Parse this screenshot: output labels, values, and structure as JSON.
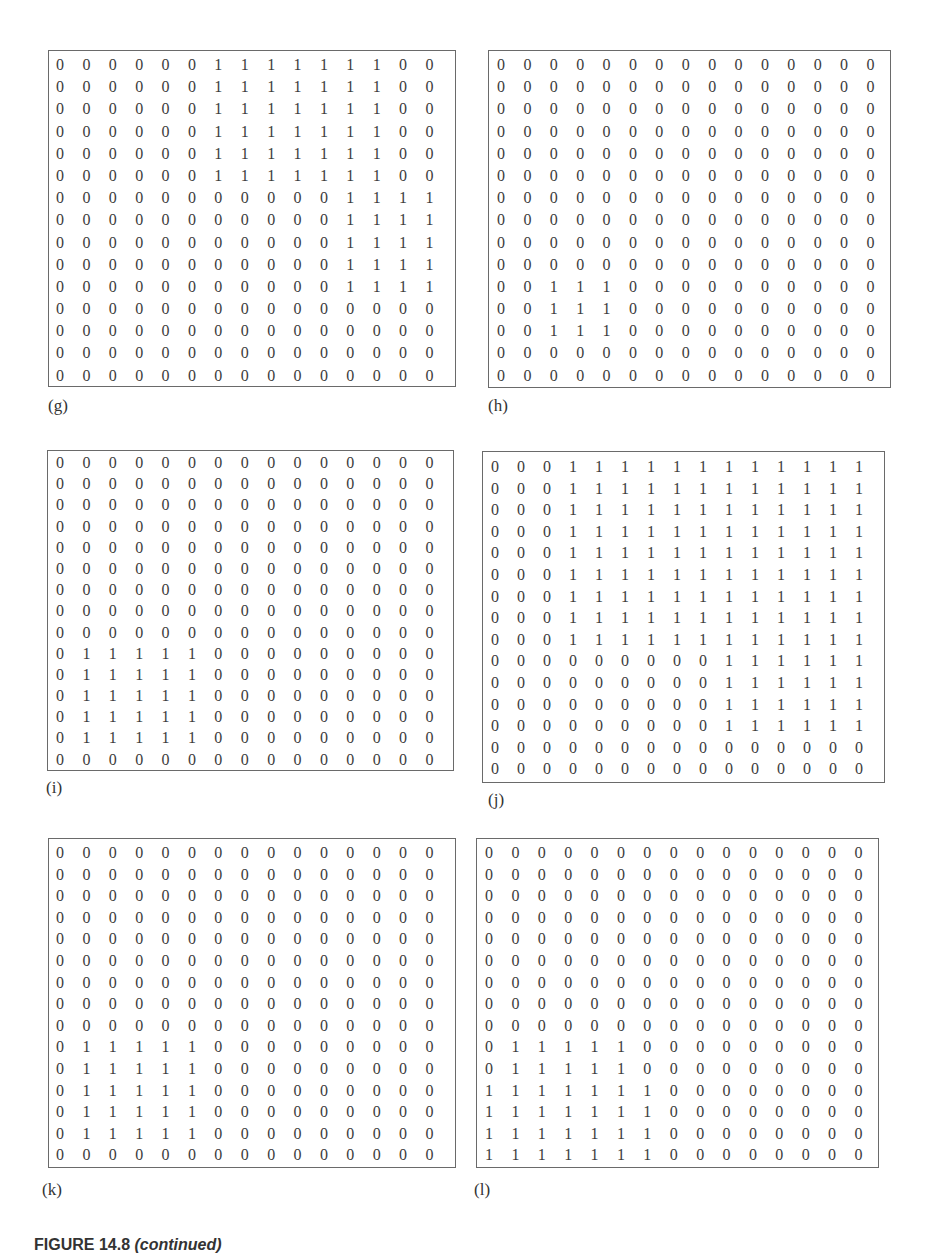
{
  "figure": {
    "caption_number": "FIGURE 14.8",
    "caption_suffix": "(continued)"
  },
  "panels": [
    {
      "label": "(g)",
      "matrix": [
        [
          0,
          0,
          0,
          0,
          0,
          0,
          1,
          1,
          1,
          1,
          1,
          1,
          1,
          0,
          0
        ],
        [
          0,
          0,
          0,
          0,
          0,
          0,
          1,
          1,
          1,
          1,
          1,
          1,
          1,
          0,
          0
        ],
        [
          0,
          0,
          0,
          0,
          0,
          0,
          1,
          1,
          1,
          1,
          1,
          1,
          1,
          0,
          0
        ],
        [
          0,
          0,
          0,
          0,
          0,
          0,
          1,
          1,
          1,
          1,
          1,
          1,
          1,
          0,
          0
        ],
        [
          0,
          0,
          0,
          0,
          0,
          0,
          1,
          1,
          1,
          1,
          1,
          1,
          1,
          0,
          0
        ],
        [
          0,
          0,
          0,
          0,
          0,
          0,
          1,
          1,
          1,
          1,
          1,
          1,
          1,
          0,
          0
        ],
        [
          0,
          0,
          0,
          0,
          0,
          0,
          0,
          0,
          0,
          0,
          0,
          1,
          1,
          1,
          1
        ],
        [
          0,
          0,
          0,
          0,
          0,
          0,
          0,
          0,
          0,
          0,
          0,
          1,
          1,
          1,
          1
        ],
        [
          0,
          0,
          0,
          0,
          0,
          0,
          0,
          0,
          0,
          0,
          0,
          1,
          1,
          1,
          1
        ],
        [
          0,
          0,
          0,
          0,
          0,
          0,
          0,
          0,
          0,
          0,
          0,
          1,
          1,
          1,
          1
        ],
        [
          0,
          0,
          0,
          0,
          0,
          0,
          0,
          0,
          0,
          0,
          0,
          1,
          1,
          1,
          1
        ],
        [
          0,
          0,
          0,
          0,
          0,
          0,
          0,
          0,
          0,
          0,
          0,
          0,
          0,
          0,
          0
        ],
        [
          0,
          0,
          0,
          0,
          0,
          0,
          0,
          0,
          0,
          0,
          0,
          0,
          0,
          0,
          0
        ],
        [
          0,
          0,
          0,
          0,
          0,
          0,
          0,
          0,
          0,
          0,
          0,
          0,
          0,
          0,
          0
        ],
        [
          0,
          0,
          0,
          0,
          0,
          0,
          0,
          0,
          0,
          0,
          0,
          0,
          0,
          0,
          0
        ]
      ]
    },
    {
      "label": "(h)",
      "matrix": [
        [
          0,
          0,
          0,
          0,
          0,
          0,
          0,
          0,
          0,
          0,
          0,
          0,
          0,
          0,
          0
        ],
        [
          0,
          0,
          0,
          0,
          0,
          0,
          0,
          0,
          0,
          0,
          0,
          0,
          0,
          0,
          0
        ],
        [
          0,
          0,
          0,
          0,
          0,
          0,
          0,
          0,
          0,
          0,
          0,
          0,
          0,
          0,
          0
        ],
        [
          0,
          0,
          0,
          0,
          0,
          0,
          0,
          0,
          0,
          0,
          0,
          0,
          0,
          0,
          0
        ],
        [
          0,
          0,
          0,
          0,
          0,
          0,
          0,
          0,
          0,
          0,
          0,
          0,
          0,
          0,
          0
        ],
        [
          0,
          0,
          0,
          0,
          0,
          0,
          0,
          0,
          0,
          0,
          0,
          0,
          0,
          0,
          0
        ],
        [
          0,
          0,
          0,
          0,
          0,
          0,
          0,
          0,
          0,
          0,
          0,
          0,
          0,
          0,
          0
        ],
        [
          0,
          0,
          0,
          0,
          0,
          0,
          0,
          0,
          0,
          0,
          0,
          0,
          0,
          0,
          0
        ],
        [
          0,
          0,
          0,
          0,
          0,
          0,
          0,
          0,
          0,
          0,
          0,
          0,
          0,
          0,
          0
        ],
        [
          0,
          0,
          0,
          0,
          0,
          0,
          0,
          0,
          0,
          0,
          0,
          0,
          0,
          0,
          0
        ],
        [
          0,
          0,
          1,
          1,
          1,
          0,
          0,
          0,
          0,
          0,
          0,
          0,
          0,
          0,
          0
        ],
        [
          0,
          0,
          1,
          1,
          1,
          0,
          0,
          0,
          0,
          0,
          0,
          0,
          0,
          0,
          0
        ],
        [
          0,
          0,
          1,
          1,
          1,
          0,
          0,
          0,
          0,
          0,
          0,
          0,
          0,
          0,
          0
        ],
        [
          0,
          0,
          0,
          0,
          0,
          0,
          0,
          0,
          0,
          0,
          0,
          0,
          0,
          0,
          0
        ],
        [
          0,
          0,
          0,
          0,
          0,
          0,
          0,
          0,
          0,
          0,
          0,
          0,
          0,
          0,
          0
        ]
      ]
    },
    {
      "label": "(i)",
      "matrix": [
        [
          0,
          0,
          0,
          0,
          0,
          0,
          0,
          0,
          0,
          0,
          0,
          0,
          0,
          0,
          0
        ],
        [
          0,
          0,
          0,
          0,
          0,
          0,
          0,
          0,
          0,
          0,
          0,
          0,
          0,
          0,
          0
        ],
        [
          0,
          0,
          0,
          0,
          0,
          0,
          0,
          0,
          0,
          0,
          0,
          0,
          0,
          0,
          0
        ],
        [
          0,
          0,
          0,
          0,
          0,
          0,
          0,
          0,
          0,
          0,
          0,
          0,
          0,
          0,
          0
        ],
        [
          0,
          0,
          0,
          0,
          0,
          0,
          0,
          0,
          0,
          0,
          0,
          0,
          0,
          0,
          0
        ],
        [
          0,
          0,
          0,
          0,
          0,
          0,
          0,
          0,
          0,
          0,
          0,
          0,
          0,
          0,
          0
        ],
        [
          0,
          0,
          0,
          0,
          0,
          0,
          0,
          0,
          0,
          0,
          0,
          0,
          0,
          0,
          0
        ],
        [
          0,
          0,
          0,
          0,
          0,
          0,
          0,
          0,
          0,
          0,
          0,
          0,
          0,
          0,
          0
        ],
        [
          0,
          0,
          0,
          0,
          0,
          0,
          0,
          0,
          0,
          0,
          0,
          0,
          0,
          0,
          0
        ],
        [
          0,
          1,
          1,
          1,
          1,
          1,
          0,
          0,
          0,
          0,
          0,
          0,
          0,
          0,
          0
        ],
        [
          0,
          1,
          1,
          1,
          1,
          1,
          0,
          0,
          0,
          0,
          0,
          0,
          0,
          0,
          0
        ],
        [
          0,
          1,
          1,
          1,
          1,
          1,
          0,
          0,
          0,
          0,
          0,
          0,
          0,
          0,
          0
        ],
        [
          0,
          1,
          1,
          1,
          1,
          1,
          0,
          0,
          0,
          0,
          0,
          0,
          0,
          0,
          0
        ],
        [
          0,
          1,
          1,
          1,
          1,
          1,
          0,
          0,
          0,
          0,
          0,
          0,
          0,
          0,
          0
        ],
        [
          0,
          0,
          0,
          0,
          0,
          0,
          0,
          0,
          0,
          0,
          0,
          0,
          0,
          0,
          0
        ]
      ]
    },
    {
      "label": "(j)",
      "matrix": [
        [
          0,
          0,
          0,
          1,
          1,
          1,
          1,
          1,
          1,
          1,
          1,
          1,
          1,
          1,
          1
        ],
        [
          0,
          0,
          0,
          1,
          1,
          1,
          1,
          1,
          1,
          1,
          1,
          1,
          1,
          1,
          1
        ],
        [
          0,
          0,
          0,
          1,
          1,
          1,
          1,
          1,
          1,
          1,
          1,
          1,
          1,
          1,
          1
        ],
        [
          0,
          0,
          0,
          1,
          1,
          1,
          1,
          1,
          1,
          1,
          1,
          1,
          1,
          1,
          1
        ],
        [
          0,
          0,
          0,
          1,
          1,
          1,
          1,
          1,
          1,
          1,
          1,
          1,
          1,
          1,
          1
        ],
        [
          0,
          0,
          0,
          1,
          1,
          1,
          1,
          1,
          1,
          1,
          1,
          1,
          1,
          1,
          1
        ],
        [
          0,
          0,
          0,
          1,
          1,
          1,
          1,
          1,
          1,
          1,
          1,
          1,
          1,
          1,
          1
        ],
        [
          0,
          0,
          0,
          1,
          1,
          1,
          1,
          1,
          1,
          1,
          1,
          1,
          1,
          1,
          1
        ],
        [
          0,
          0,
          0,
          1,
          1,
          1,
          1,
          1,
          1,
          1,
          1,
          1,
          1,
          1,
          1
        ],
        [
          0,
          0,
          0,
          0,
          0,
          0,
          0,
          0,
          0,
          1,
          1,
          1,
          1,
          1,
          1
        ],
        [
          0,
          0,
          0,
          0,
          0,
          0,
          0,
          0,
          0,
          1,
          1,
          1,
          1,
          1,
          1
        ],
        [
          0,
          0,
          0,
          0,
          0,
          0,
          0,
          0,
          0,
          1,
          1,
          1,
          1,
          1,
          1
        ],
        [
          0,
          0,
          0,
          0,
          0,
          0,
          0,
          0,
          0,
          1,
          1,
          1,
          1,
          1,
          1
        ],
        [
          0,
          0,
          0,
          0,
          0,
          0,
          0,
          0,
          0,
          0,
          0,
          0,
          0,
          0,
          0
        ],
        [
          0,
          0,
          0,
          0,
          0,
          0,
          0,
          0,
          0,
          0,
          0,
          0,
          0,
          0,
          0
        ]
      ]
    },
    {
      "label": "(k)",
      "matrix": [
        [
          0,
          0,
          0,
          0,
          0,
          0,
          0,
          0,
          0,
          0,
          0,
          0,
          0,
          0,
          0
        ],
        [
          0,
          0,
          0,
          0,
          0,
          0,
          0,
          0,
          0,
          0,
          0,
          0,
          0,
          0,
          0
        ],
        [
          0,
          0,
          0,
          0,
          0,
          0,
          0,
          0,
          0,
          0,
          0,
          0,
          0,
          0,
          0
        ],
        [
          0,
          0,
          0,
          0,
          0,
          0,
          0,
          0,
          0,
          0,
          0,
          0,
          0,
          0,
          0
        ],
        [
          0,
          0,
          0,
          0,
          0,
          0,
          0,
          0,
          0,
          0,
          0,
          0,
          0,
          0,
          0
        ],
        [
          0,
          0,
          0,
          0,
          0,
          0,
          0,
          0,
          0,
          0,
          0,
          0,
          0,
          0,
          0
        ],
        [
          0,
          0,
          0,
          0,
          0,
          0,
          0,
          0,
          0,
          0,
          0,
          0,
          0,
          0,
          0
        ],
        [
          0,
          0,
          0,
          0,
          0,
          0,
          0,
          0,
          0,
          0,
          0,
          0,
          0,
          0,
          0
        ],
        [
          0,
          0,
          0,
          0,
          0,
          0,
          0,
          0,
          0,
          0,
          0,
          0,
          0,
          0,
          0
        ],
        [
          0,
          1,
          1,
          1,
          1,
          1,
          0,
          0,
          0,
          0,
          0,
          0,
          0,
          0,
          0
        ],
        [
          0,
          1,
          1,
          1,
          1,
          1,
          0,
          0,
          0,
          0,
          0,
          0,
          0,
          0,
          0
        ],
        [
          0,
          1,
          1,
          1,
          1,
          1,
          0,
          0,
          0,
          0,
          0,
          0,
          0,
          0,
          0
        ],
        [
          0,
          1,
          1,
          1,
          1,
          1,
          0,
          0,
          0,
          0,
          0,
          0,
          0,
          0,
          0
        ],
        [
          0,
          1,
          1,
          1,
          1,
          1,
          0,
          0,
          0,
          0,
          0,
          0,
          0,
          0,
          0
        ],
        [
          0,
          0,
          0,
          0,
          0,
          0,
          0,
          0,
          0,
          0,
          0,
          0,
          0,
          0,
          0
        ]
      ]
    },
    {
      "label": "(l)",
      "matrix": [
        [
          0,
          0,
          0,
          0,
          0,
          0,
          0,
          0,
          0,
          0,
          0,
          0,
          0,
          0,
          0
        ],
        [
          0,
          0,
          0,
          0,
          0,
          0,
          0,
          0,
          0,
          0,
          0,
          0,
          0,
          0,
          0
        ],
        [
          0,
          0,
          0,
          0,
          0,
          0,
          0,
          0,
          0,
          0,
          0,
          0,
          0,
          0,
          0
        ],
        [
          0,
          0,
          0,
          0,
          0,
          0,
          0,
          0,
          0,
          0,
          0,
          0,
          0,
          0,
          0
        ],
        [
          0,
          0,
          0,
          0,
          0,
          0,
          0,
          0,
          0,
          0,
          0,
          0,
          0,
          0,
          0
        ],
        [
          0,
          0,
          0,
          0,
          0,
          0,
          0,
          0,
          0,
          0,
          0,
          0,
          0,
          0,
          0
        ],
        [
          0,
          0,
          0,
          0,
          0,
          0,
          0,
          0,
          0,
          0,
          0,
          0,
          0,
          0,
          0
        ],
        [
          0,
          0,
          0,
          0,
          0,
          0,
          0,
          0,
          0,
          0,
          0,
          0,
          0,
          0,
          0
        ],
        [
          0,
          0,
          0,
          0,
          0,
          0,
          0,
          0,
          0,
          0,
          0,
          0,
          0,
          0,
          0
        ],
        [
          0,
          1,
          1,
          1,
          1,
          1,
          0,
          0,
          0,
          0,
          0,
          0,
          0,
          0,
          0
        ],
        [
          0,
          1,
          1,
          1,
          1,
          1,
          0,
          0,
          0,
          0,
          0,
          0,
          0,
          0,
          0
        ],
        [
          1,
          1,
          1,
          1,
          1,
          1,
          1,
          0,
          0,
          0,
          0,
          0,
          0,
          0,
          0
        ],
        [
          1,
          1,
          1,
          1,
          1,
          1,
          1,
          0,
          0,
          0,
          0,
          0,
          0,
          0,
          0
        ],
        [
          1,
          1,
          1,
          1,
          1,
          1,
          1,
          0,
          0,
          0,
          0,
          0,
          0,
          0,
          0
        ],
        [
          1,
          1,
          1,
          1,
          1,
          1,
          1,
          0,
          0,
          0,
          0,
          0,
          0,
          0,
          0
        ]
      ]
    }
  ]
}
